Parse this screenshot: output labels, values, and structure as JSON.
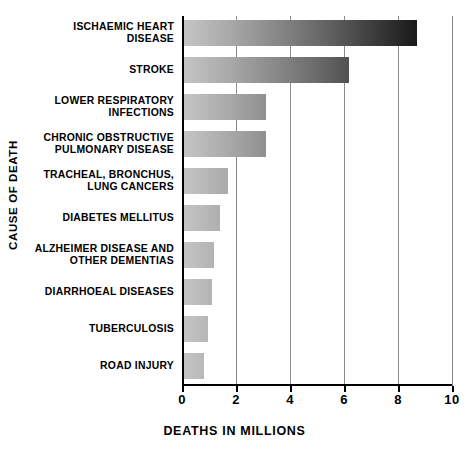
{
  "chart_data": {
    "type": "bar",
    "orientation": "horizontal",
    "title": "",
    "xlabel": "DEATHS IN MILLIONS",
    "ylabel": "CAUSE OF DEATH",
    "categories": [
      "ISCHAEMIC HEART DISEASE",
      "STROKE",
      "LOWER RESPIRATORY INFECTIONS",
      "CHRONIC OBSTRUCTIVE PULMONARY DISEASE",
      "TRACHEAL, BRONCHUS, LUNG CANCERS",
      "DIABETES MELLITUS",
      "ALZHEIMER DISEASE AND OTHER DEMENTIAS",
      "DIARRHOEAL DISEASES",
      "TUBERCULOSIS",
      "ROAD INJURY"
    ],
    "category_lines": [
      [
        "ISCHAEMIC HEART",
        "DISEASE"
      ],
      [
        "STROKE"
      ],
      [
        "LOWER RESPIRATORY",
        "INFECTIONS"
      ],
      [
        "CHRONIC OBSTRUCTIVE",
        "PULMONARY DISEASE"
      ],
      [
        "TRACHEAL, BRONCHUS,",
        "LUNG CANCERS"
      ],
      [
        "DIABETES MELLITUS"
      ],
      [
        "ALZHEIMER DISEASE AND",
        "OTHER DEMENTIAS"
      ],
      [
        "DIARRHOEAL DISEASES"
      ],
      [
        "TUBERCULOSIS"
      ],
      [
        "ROAD INJURY"
      ]
    ],
    "values": [
      8.7,
      6.2,
      3.1,
      3.1,
      1.7,
      1.4,
      1.2,
      1.1,
      0.95,
      0.8
    ],
    "xlim": [
      0,
      10
    ],
    "xticks": [
      0,
      2,
      4,
      6,
      8,
      10
    ],
    "xtick_labels": [
      "0",
      "2",
      "4",
      "6",
      "8",
      "10"
    ],
    "grid": true,
    "grid_axis": "x",
    "legend": false,
    "bar_style": "grayscale-gradient",
    "bar_gradient_from": "#c6c6c6",
    "bar_gradient_to": "#080808",
    "axis_color": "#000000",
    "gridline_color": "#8c8c8c",
    "background": "#ffffff"
  }
}
